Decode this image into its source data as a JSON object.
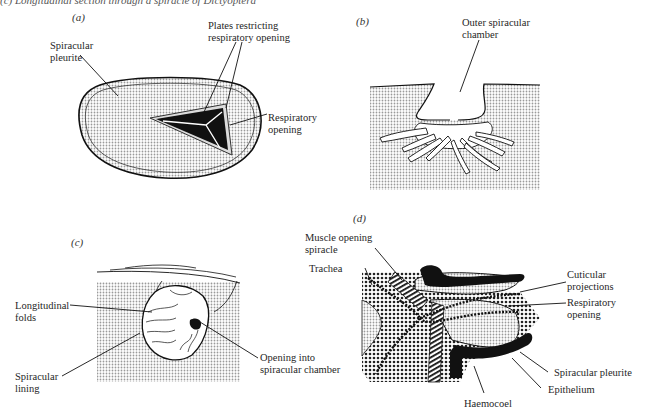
{
  "caption": "(c) Longitudinal section through a spiracle of Dictyoptera",
  "panels": {
    "a": {
      "label": "(a)",
      "annotations": {
        "spiracular_pleurite": "Spiracular\npleurite",
        "plates": "Plates restricting\nrespiratory opening",
        "respiratory_opening": "Respiratory\nopening"
      }
    },
    "b": {
      "label": "(b)",
      "annotations": {
        "outer_chamber": "Outer spiracular\nchamber"
      }
    },
    "c": {
      "label": "(c)",
      "annotations": {
        "longitudinal_folds": "Longitudinal\nfolds",
        "spiracular_lining": "Spiracular\nlining",
        "opening_into_chamber": "Opening into\nspiracular chamber"
      }
    },
    "d": {
      "label": "(d)",
      "annotations": {
        "muscle": "Muscle opening\nspiracle",
        "trachea": "Trachea",
        "cuticular_projections": "Cuticular\nprojections",
        "respiratory_opening": "Respiratory\nopening",
        "spiracular_pleurite": "Spiracular pleurite",
        "epithelium": "Epithelium",
        "haemocoel": "Haemocoel"
      }
    }
  },
  "colors": {
    "stipple": "#bdbdbd",
    "ink": "#111111",
    "dense_stipple": "#8a8a8a"
  }
}
